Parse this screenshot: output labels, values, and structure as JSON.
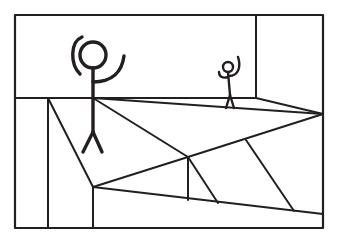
{
  "scene": {
    "title": "Stick figure line drawing",
    "description": "Hand-drawn black-and-white line sketch of a rectangular room interior in perspective, with a large stick figure with arms raised in the foreground and a smaller stick figure with arms raised standing near the back-right wall.",
    "medium": "ink line drawing",
    "background_color": "#ffffff",
    "ink_color": "#231f20",
    "canvas": {
      "width": 339,
      "height": 242
    }
  },
  "frame": {
    "name": "outer-border",
    "shape": "rectangle",
    "left": 15,
    "top": 15,
    "right": 323,
    "bottom": 228
  },
  "room": {
    "horizon_line": {
      "label": "back-wall-baseline",
      "x1": 15,
      "y1": 98,
      "x2": 256,
      "y2": 98
    },
    "back_wall_right_edge": {
      "label": "wall-corner-vertical",
      "x1": 256,
      "y1": 15,
      "x2": 256,
      "y2": 98
    },
    "right_wall_floor_edge": {
      "label": "right-wall-floor-edge",
      "x1": 256,
      "y1": 98,
      "x2": 323,
      "y2": 114
    },
    "left_wall_edge": {
      "label": "left-wall-vertical",
      "x1": 48,
      "y1": 98,
      "x2": 48,
      "y2": 228
    },
    "left_panel_diagonal": {
      "label": "left-floor-diagonal",
      "x1": 48,
      "y1": 98,
      "x2": 93,
      "y2": 187
    },
    "left_panel_vertical": {
      "label": "left-floor-vertical",
      "x1": 93,
      "y1": 187,
      "x2": 93,
      "y2": 228
    }
  },
  "floor_lines": [
    {
      "name": "floor-edge-upper-long",
      "x1": 93,
      "y1": 98,
      "x2": 323,
      "y2": 114
    },
    {
      "name": "floor-edge-to-junction",
      "x1": 93,
      "y1": 98,
      "x2": 188,
      "y2": 157
    },
    {
      "name": "floor-edge-junction-right",
      "x1": 188,
      "y1": 157,
      "x2": 323,
      "y2": 114
    },
    {
      "name": "floor-edge-junction-left",
      "x1": 188,
      "y1": 157,
      "x2": 93,
      "y2": 187
    },
    {
      "name": "floor-wedge-vertical",
      "x1": 188,
      "y1": 157,
      "x2": 188,
      "y2": 200
    },
    {
      "name": "floor-wedge-diagonal-inner",
      "x1": 188,
      "y1": 157,
      "x2": 218,
      "y2": 203
    },
    {
      "name": "floor-wedge-diagonal-outer",
      "x1": 246,
      "y1": 140,
      "x2": 294,
      "y2": 211
    },
    {
      "name": "floor-front-edge",
      "x1": 93,
      "y1": 187,
      "x2": 323,
      "y2": 214
    }
  ],
  "figures": [
    {
      "id": "large-stick-figure",
      "label": "Large stick figure (foreground, arms raised)",
      "scale": "large",
      "head": {
        "cx": 93,
        "cy": 55,
        "r": 13
      },
      "body": {
        "x1": 93,
        "y1": 68,
        "x2": 93,
        "y2": 132
      },
      "arm_left_arc": "M 80 74 C 70 64, 70 42, 82 37",
      "arm_right_arc": "M 93 82 C 112 82, 122 72, 124 56",
      "leg_left": {
        "x1": 93,
        "y1": 132,
        "x2": 83,
        "y2": 152
      },
      "leg_right": {
        "x1": 93,
        "y1": 132,
        "x2": 102,
        "y2": 152
      }
    },
    {
      "id": "small-stick-figure",
      "label": "Small stick figure (background, arms raised)",
      "scale": "small",
      "head": {
        "cx": 228,
        "cy": 67,
        "r": 5
      },
      "body": {
        "x1": 228,
        "y1": 72,
        "x2": 230,
        "y2": 95
      },
      "arm_left_arc": "M 228 77 C 222 79, 219 76, 219 72",
      "arm_right_arc": "M 229 76 C 239 76, 241 66, 238 57",
      "leg_left": {
        "x1": 230,
        "y1": 95,
        "x2": 226,
        "y2": 108
      },
      "leg_right": {
        "x1": 230,
        "y1": 95,
        "x2": 234,
        "y2": 108
      }
    }
  ]
}
